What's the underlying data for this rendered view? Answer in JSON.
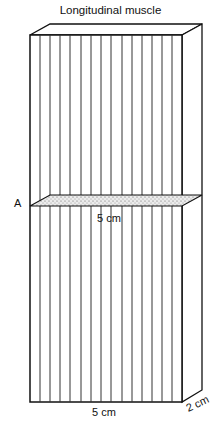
{
  "title": "Longitudinal muscle",
  "labels": {
    "section": "A",
    "section_width": "5 cm",
    "bottom_width": "5 cm",
    "depth": "2 cm"
  },
  "colors": {
    "stroke": "#111111",
    "fiber": "#333333",
    "section_fill": "#d8d8d8"
  }
}
